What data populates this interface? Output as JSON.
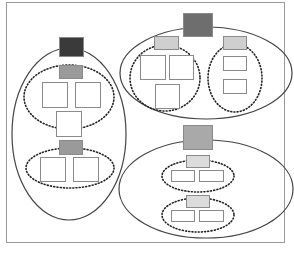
{
  "diagram": {
    "type": "nested-group-hierarchy",
    "colors": {
      "background": "#ffffff",
      "frame_stroke": "#9a9a9a",
      "ellipse_stroke": "#444444",
      "dotted_stroke": "#222222",
      "box_stroke": "#8a8a8a",
      "dark_header": "#3a3a3a",
      "mid_header": "#7a7a7a",
      "light_header": "#a9a9a9",
      "sub_header_dark": "#9a9a9a",
      "sub_header_light": "#d4d4d4",
      "leaf_fill": "#ffffff"
    },
    "frame": {
      "x": 6,
      "y": 2,
      "w": 278,
      "h": 240
    },
    "groups": [
      {
        "name": "left-group",
        "ellipse": {
          "cx": 69,
          "cy": 134,
          "rx": 57,
          "ry": 86
        },
        "header": {
          "x": 59,
          "y": 37,
          "w": 24,
          "h": 19,
          "fill": "#3a3a3a"
        },
        "subgroups": [
          {
            "name": "left-subgroup-1",
            "ellipse": {
              "cx": 69,
              "cy": 97,
              "rx": 45,
              "ry": 32
            },
            "header": {
              "x": 59,
              "y": 65,
              "w": 23,
              "h": 13,
              "fill": "#9a9a9a"
            },
            "leaves": [
              {
                "x": 42,
                "y": 82,
                "w": 25,
                "h": 25
              },
              {
                "x": 75,
                "y": 82,
                "w": 25,
                "h": 25
              },
              {
                "x": 56,
                "y": 111,
                "w": 25,
                "h": 25
              }
            ]
          },
          {
            "name": "left-subgroup-2",
            "ellipse": {
              "cx": 70,
              "cy": 168,
              "rx": 44,
              "ry": 20
            },
            "header": {
              "x": 59,
              "y": 140,
              "w": 23,
              "h": 14,
              "fill": "#9a9a9a"
            },
            "leaves": [
              {
                "x": 40,
                "y": 157,
                "w": 25,
                "h": 24
              },
              {
                "x": 73,
                "y": 157,
                "w": 25,
                "h": 24
              }
            ]
          }
        ]
      },
      {
        "name": "top-right-group",
        "ellipse": {
          "cx": 206,
          "cy": 73,
          "rx": 86,
          "ry": 46
        },
        "header": {
          "x": 183,
          "y": 13,
          "w": 29,
          "h": 23,
          "fill": "#6e6e6e"
        },
        "subgroups": [
          {
            "name": "top-right-subgroup-1",
            "ellipse": {
              "cx": 165,
              "cy": 78,
              "rx": 35,
              "ry": 33
            },
            "header": {
              "x": 154,
              "y": 36,
              "w": 24,
              "h": 13,
              "fill": "#cfcfcf"
            },
            "leaves": [
              {
                "x": 140,
                "y": 55,
                "w": 25,
                "h": 24
              },
              {
                "x": 169,
                "y": 55,
                "w": 24,
                "h": 24
              },
              {
                "x": 155,
                "y": 84,
                "w": 24,
                "h": 24
              }
            ]
          },
          {
            "name": "top-right-subgroup-2",
            "ellipse": {
              "cx": 235,
              "cy": 78,
              "rx": 27,
              "ry": 34
            },
            "header": {
              "x": 223,
              "y": 36,
              "w": 23,
              "h": 13,
              "fill": "#cfcfcf"
            },
            "leaves": [
              {
                "x": 223,
                "y": 56,
                "w": 23,
                "h": 14
              },
              {
                "x": 223,
                "y": 79,
                "w": 23,
                "h": 14
              }
            ]
          }
        ]
      },
      {
        "name": "bottom-right-group",
        "ellipse": {
          "cx": 206,
          "cy": 189,
          "rx": 87,
          "ry": 49
        },
        "header": {
          "x": 183,
          "y": 125,
          "w": 29,
          "h": 24,
          "fill": "#a9a9a9"
        },
        "subgroups": [
          {
            "name": "bottom-right-subgroup-1",
            "ellipse": {
              "cx": 198,
              "cy": 176,
              "rx": 36,
              "ry": 16
            },
            "header": {
              "x": 186,
              "y": 155,
              "w": 23,
              "h": 12,
              "fill": "#dcdcdc"
            },
            "leaves": [
              {
                "x": 171,
                "y": 170,
                "w": 23,
                "h": 11
              },
              {
                "x": 199,
                "y": 170,
                "w": 24,
                "h": 11
              }
            ]
          },
          {
            "name": "bottom-right-subgroup-2",
            "ellipse": {
              "cx": 198,
              "cy": 215,
              "rx": 36,
              "ry": 17
            },
            "header": {
              "x": 186,
              "y": 195,
              "w": 23,
              "h": 12,
              "fill": "#dcdcdc"
            },
            "leaves": [
              {
                "x": 171,
                "y": 210,
                "w": 23,
                "h": 11
              },
              {
                "x": 199,
                "y": 210,
                "w": 24,
                "h": 11
              }
            ]
          }
        ]
      }
    ]
  }
}
